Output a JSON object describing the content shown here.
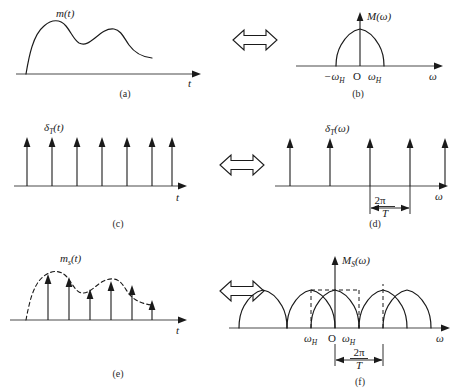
{
  "figure": {
    "panels": [
      {
        "id": "a",
        "caption": "(a)",
        "domain": "time",
        "signal_label": "m(t)",
        "axis_label": "t",
        "description": "Continuous baseband message signal m(t) with two humps"
      },
      {
        "id": "b",
        "caption": "(b)",
        "domain": "frequency",
        "signal_label": "M(ω)",
        "axis_label": "ω",
        "ticks": [
          "−ω",
          "O",
          "ω"
        ],
        "tick_sub": [
          "H",
          "",
          "H"
        ],
        "description": "Band-limited spectrum M(omega) confined between -omegaH and +omegaH"
      },
      {
        "id": "c",
        "caption": "(c)",
        "domain": "time",
        "signal_label": "δ",
        "signal_sub": "T",
        "signal_arg": "(t)",
        "axis_label": "t",
        "impulse_count": 7,
        "description": "Uniform impulse train delta_T(t) of period T"
      },
      {
        "id": "d",
        "caption": "(d)",
        "domain": "frequency",
        "signal_label": "δ",
        "signal_sub": "T",
        "signal_arg": "(ω)",
        "axis_label": "ω",
        "impulse_count": 5,
        "measure_num": "2π",
        "measure_den": "T",
        "description": "Impulse train in frequency with spacing 2 pi over T"
      },
      {
        "id": "e",
        "caption": "(e)",
        "domain": "time",
        "signal_label": "m",
        "signal_sub": "s",
        "signal_arg": "(t)",
        "axis_label": "t",
        "impulse_count": 6,
        "description": "Sampled signal m_s(t): impulses weighted by dashed envelope m(t)"
      },
      {
        "id": "f",
        "caption": "(f)",
        "domain": "frequency",
        "signal_label": "M",
        "signal_sub": "S",
        "signal_arg": "(ω)",
        "axis_label": "ω",
        "ticks": [
          "ω",
          "O",
          "ω"
        ],
        "tick_sub": [
          "H",
          "",
          "H"
        ],
        "replica_count": 5,
        "measure_num": "2π",
        "measure_den": "T",
        "description": "Periodic replication of M(omega) every 2 pi over T with dashed reconstruction filter box"
      }
    ],
    "equivalence_arrows": [
      {
        "row": "a-b",
        "name": "transform-pair-arrow-1",
        "glyph": "double-headed-hollow-arrow"
      },
      {
        "row": "c-d",
        "name": "transform-pair-arrow-2",
        "glyph": "double-headed-hollow-arrow"
      },
      {
        "row": "e-f",
        "name": "transform-pair-arrow-3",
        "glyph": "double-headed-hollow-arrow"
      }
    ],
    "colors": {
      "ink": "#1a1a1a",
      "axis": "#4a4a4a",
      "background": "#ffffff"
    }
  }
}
